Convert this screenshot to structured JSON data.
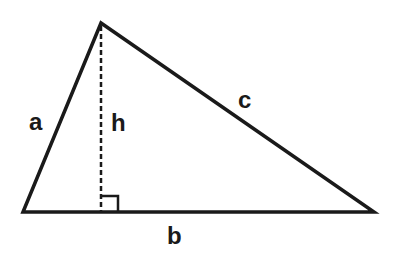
{
  "diagram": {
    "type": "triangle-with-altitude",
    "colors": {
      "stroke": "#1a1a1a",
      "background": "#ffffff"
    },
    "vertices": {
      "left": [
        23,
        212
      ],
      "apex": [
        101,
        23
      ],
      "right": [
        374,
        212
      ]
    },
    "labels": {
      "side_a": "a",
      "side_b": "b",
      "side_c": "c",
      "height": "h"
    },
    "right_angle_marker": true
  }
}
